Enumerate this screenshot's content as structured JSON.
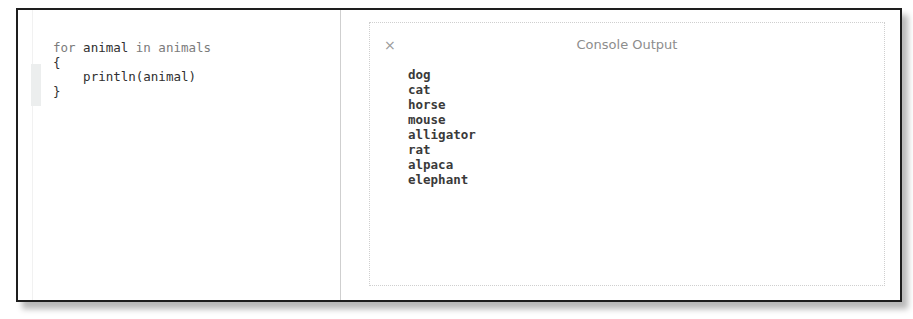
{
  "editor": {
    "code_lines": [
      {
        "keyword": "for",
        "var": " animal",
        "keyword2": " in",
        "iter": " animals"
      },
      {
        "text": "{"
      },
      {
        "text": "    println(animal)"
      },
      {
        "text": "}"
      }
    ]
  },
  "console": {
    "close_icon": "×",
    "title": "Console Output",
    "lines": [
      "dog",
      "cat",
      "horse",
      "mouse",
      "alligator",
      "rat",
      "alpaca",
      "elephant"
    ]
  }
}
